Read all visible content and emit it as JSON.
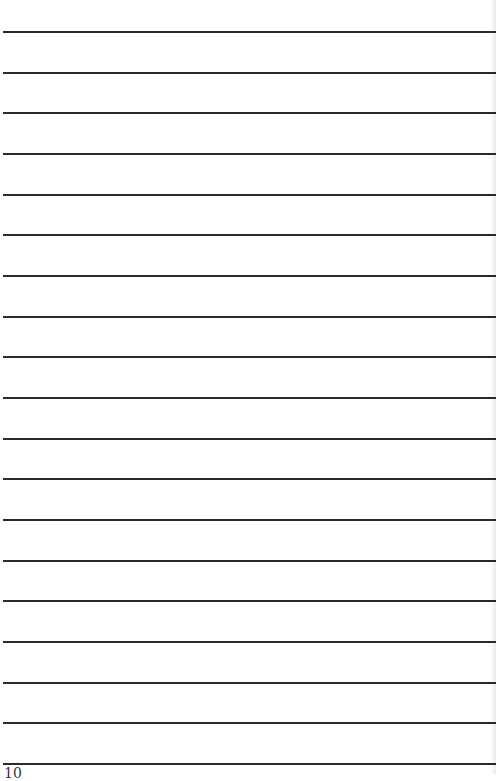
{
  "page": {
    "type": "lined-notebook-page",
    "line_count": 19,
    "first_line_y": 31,
    "line_spacing": 40.67,
    "line_color": "#2a2a2a",
    "background": "#ffffff",
    "page_number": "10"
  }
}
